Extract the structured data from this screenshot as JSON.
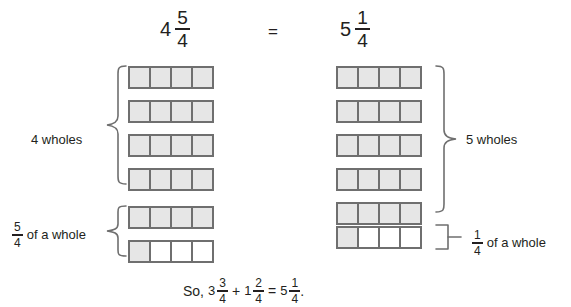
{
  "header": {
    "left_expression": {
      "whole": "4",
      "numerator": "5",
      "denominator": "4"
    },
    "equals": "=",
    "right_expression": {
      "whole": "5",
      "numerator": "1",
      "denominator": "4"
    }
  },
  "left_column": {
    "wholes_label": "4 wholes",
    "fraction_label": {
      "numerator": "5",
      "denominator": "4",
      "text": "of a whole"
    },
    "wholes_bars": [
      {
        "cells": [
          "shaded",
          "shaded",
          "shaded",
          "shaded"
        ]
      },
      {
        "cells": [
          "shaded",
          "shaded",
          "shaded",
          "shaded"
        ]
      },
      {
        "cells": [
          "shaded",
          "shaded",
          "shaded",
          "shaded"
        ]
      },
      {
        "cells": [
          "shaded",
          "shaded",
          "shaded",
          "shaded"
        ]
      }
    ],
    "fraction_bars": [
      {
        "cells": [
          "shaded",
          "shaded",
          "shaded",
          "shaded"
        ]
      },
      {
        "cells": [
          "shaded",
          "empty",
          "empty",
          "empty"
        ]
      }
    ]
  },
  "right_column": {
    "wholes_label": "5 wholes",
    "fraction_label": {
      "numerator": "1",
      "denominator": "4",
      "text": "of a whole"
    },
    "wholes_bars": [
      {
        "cells": [
          "shaded",
          "shaded",
          "shaded",
          "shaded"
        ]
      },
      {
        "cells": [
          "shaded",
          "shaded",
          "shaded",
          "shaded"
        ]
      },
      {
        "cells": [
          "shaded",
          "shaded",
          "shaded",
          "shaded"
        ]
      },
      {
        "cells": [
          "shaded",
          "shaded",
          "shaded",
          "shaded"
        ]
      },
      {
        "cells": [
          "shaded",
          "shaded",
          "shaded",
          "shaded"
        ]
      }
    ],
    "fraction_bars": [
      {
        "cells": [
          "shaded",
          "empty",
          "empty",
          "empty"
        ]
      }
    ]
  },
  "conclusion": {
    "lead": "So,",
    "term1": {
      "whole": "3",
      "numerator": "3",
      "denominator": "4"
    },
    "plus": "+",
    "term2": {
      "whole": "1",
      "numerator": "2",
      "denominator": "4"
    },
    "equals": "=",
    "result": {
      "whole": "5",
      "numerator": "1",
      "denominator": "4"
    },
    "period": "."
  },
  "colors": {
    "cell_fill": "#e6e6e6",
    "cell_border": "#6f6f6f",
    "text": "#231f20",
    "brace": "#6f6f6f",
    "background": "#ffffff"
  }
}
